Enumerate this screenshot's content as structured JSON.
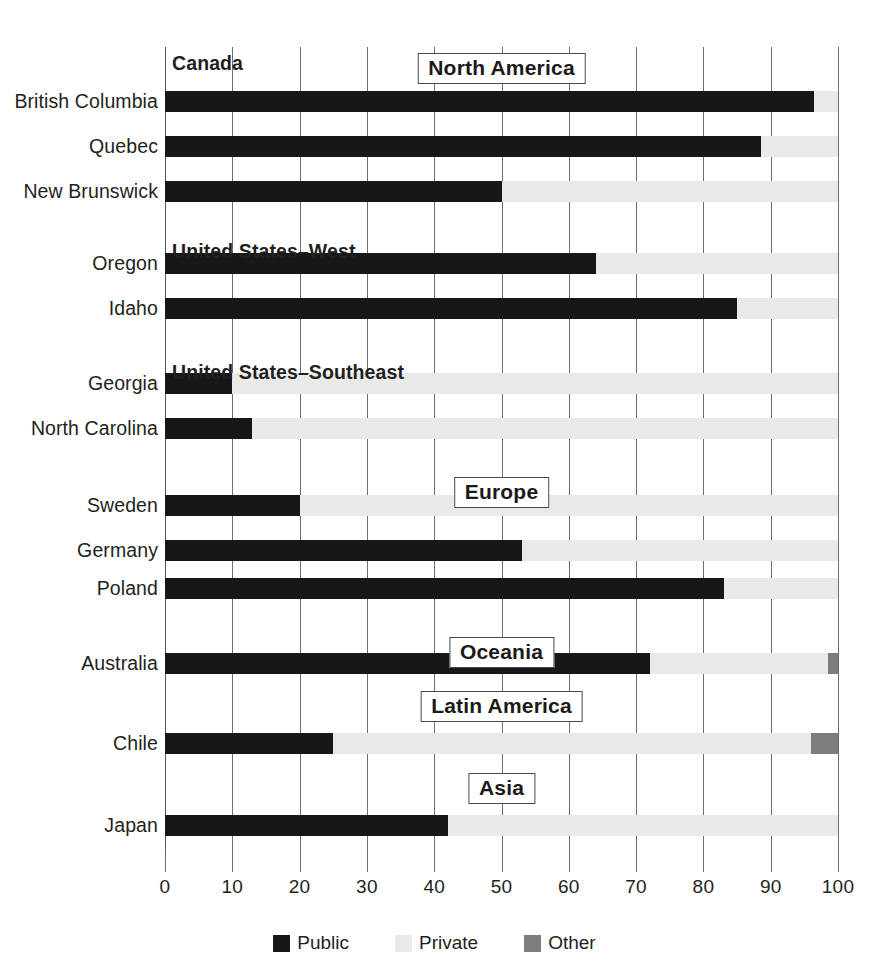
{
  "chart_data": {
    "type": "bar",
    "orientation": "horizontal",
    "stacked": true,
    "title": "",
    "xlabel": "",
    "ylabel": "",
    "xlim": [
      0,
      100
    ],
    "xticks": [
      0,
      10,
      20,
      30,
      40,
      50,
      60,
      70,
      80,
      90,
      100
    ],
    "xtick_labels": [
      "0",
      "10",
      "20",
      "30",
      "40",
      "50",
      "60",
      "70",
      "80",
      "90",
      "100"
    ],
    "grid": true,
    "grid_axis": "x",
    "legend": {
      "position": "bottom",
      "entries": [
        {
          "label": "Public",
          "color": "#17171a",
          "key": "public"
        },
        {
          "label": "Private",
          "color": "#e9e9e9",
          "key": "private"
        },
        {
          "label": "Other",
          "color": "#7d7d7d",
          "key": "other"
        }
      ]
    },
    "series": [
      {
        "name": "Public",
        "color": "#17171a"
      },
      {
        "name": "Private",
        "color": "#e9e9e9"
      },
      {
        "name": "Other",
        "color": "#7d7d7d"
      }
    ],
    "groups": [
      {
        "label": "North America",
        "style": "boxed",
        "box_center_x": 50,
        "subgroups": [
          {
            "label": "Canada",
            "style": "plain",
            "categories": [
              "British Columbia",
              "Quebec",
              "New Brunswick"
            ],
            "values": [
              {
                "category": "British Columbia",
                "public": 96.5,
                "private": 3.5,
                "other": 0
              },
              {
                "category": "Quebec",
                "public": 88.5,
                "private": 11.5,
                "other": 0
              },
              {
                "category": "New Brunswick",
                "public": 50.0,
                "private": 50.0,
                "other": 0
              }
            ]
          },
          {
            "label": "United States–West",
            "style": "plain",
            "categories": [
              "Oregon",
              "Idaho"
            ],
            "values": [
              {
                "category": "Oregon",
                "public": 64.0,
                "private": 36.0,
                "other": 0
              },
              {
                "category": "Idaho",
                "public": 85.0,
                "private": 15.0,
                "other": 0
              }
            ]
          },
          {
            "label": "United States–Southeast",
            "style": "plain",
            "categories": [
              "Georgia",
              "North Carolina"
            ],
            "values": [
              {
                "category": "Georgia",
                "public": 10.0,
                "private": 90.0,
                "other": 0
              },
              {
                "category": "North Carolina",
                "public": 13.0,
                "private": 87.0,
                "other": 0
              }
            ]
          }
        ]
      },
      {
        "label": "Europe",
        "style": "boxed",
        "box_center_x": 50,
        "subgroups": [
          {
            "label": "",
            "style": "none",
            "categories": [
              "Sweden",
              "Germany",
              "Poland"
            ],
            "values": [
              {
                "category": "Sweden",
                "public": 20.0,
                "private": 80.0,
                "other": 0
              },
              {
                "category": "Germany",
                "public": 53.0,
                "private": 47.0,
                "other": 0
              },
              {
                "category": "Poland",
                "public": 83.0,
                "private": 17.0,
                "other": 0
              }
            ]
          }
        ]
      },
      {
        "label": "Oceania",
        "style": "boxed",
        "box_center_x": 50,
        "subgroups": [
          {
            "label": "",
            "style": "none",
            "categories": [
              "Australia"
            ],
            "values": [
              {
                "category": "Australia",
                "public": 72.0,
                "private": 26.5,
                "other": 1.5
              }
            ]
          }
        ]
      },
      {
        "label": "Latin America",
        "style": "boxed",
        "box_center_x": 50,
        "subgroups": [
          {
            "label": "",
            "style": "none",
            "categories": [
              "Chile"
            ],
            "values": [
              {
                "category": "Chile",
                "public": 25.0,
                "private": 71.0,
                "other": 4.0
              }
            ]
          }
        ]
      },
      {
        "label": "Asia",
        "style": "boxed",
        "box_center_x": 50,
        "subgroups": [
          {
            "label": "",
            "style": "none",
            "categories": [
              "Japan"
            ],
            "values": [
              {
                "category": "Japan",
                "public": 42.0,
                "private": 58.0,
                "other": 0
              }
            ]
          }
        ]
      }
    ]
  },
  "layout": {
    "rows": [
      {
        "kind": "group-plain",
        "label": "Canada",
        "y": 52
      },
      {
        "kind": "bar",
        "category": "British Columbia",
        "y": 91
      },
      {
        "kind": "bar",
        "category": "Quebec",
        "y": 136
      },
      {
        "kind": "bar",
        "category": "New Brunswick",
        "y": 181
      },
      {
        "kind": "group-plain",
        "label": "United States–West",
        "y": 240
      },
      {
        "kind": "bar",
        "category": "Oregon",
        "y": 253
      },
      {
        "kind": "bar",
        "category": "Idaho",
        "y": 298
      },
      {
        "kind": "group-plain",
        "label": "United States–Southeast",
        "y": 361
      },
      {
        "kind": "bar",
        "category": "Georgia",
        "y": 373
      },
      {
        "kind": "bar",
        "category": "North Carolina",
        "y": 418
      },
      {
        "kind": "bar",
        "category": "Sweden",
        "y": 495
      },
      {
        "kind": "bar",
        "category": "Germany",
        "y": 540
      },
      {
        "kind": "bar",
        "category": "Poland",
        "y": 578
      },
      {
        "kind": "bar",
        "category": "Australia",
        "y": 653
      },
      {
        "kind": "bar",
        "category": "Chile",
        "y": 733
      },
      {
        "kind": "bar",
        "category": "Japan",
        "y": 815
      }
    ],
    "boxed_labels": [
      {
        "label": "North America",
        "y": 53
      },
      {
        "label": "Europe",
        "y": 477
      },
      {
        "label": "Oceania",
        "y": 637
      },
      {
        "label": "Latin America",
        "y": 691
      },
      {
        "label": "Asia",
        "y": 773
      }
    ]
  }
}
